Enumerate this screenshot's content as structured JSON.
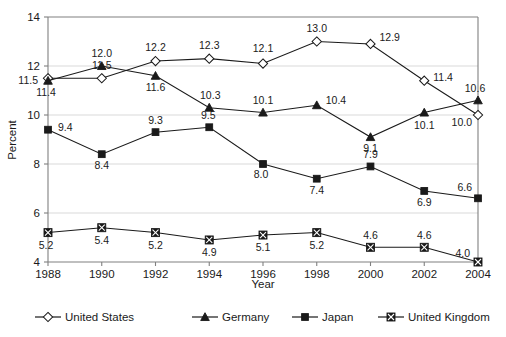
{
  "chart_data": {
    "type": "line",
    "title": "",
    "xlabel": "Year",
    "ylabel": "Percent",
    "x": [
      1988,
      1990,
      1992,
      1994,
      1996,
      1998,
      2000,
      2002,
      2004
    ],
    "xtick_labels": [
      "1988",
      "1990",
      "1992",
      "1994",
      "1996",
      "1998",
      "2000",
      "2002",
      "2004"
    ],
    "ytick_labels": [
      "4",
      "6",
      "8",
      "10",
      "12",
      "14"
    ],
    "yticks": [
      4,
      6,
      8,
      10,
      12,
      14
    ],
    "ylim": [
      4,
      14
    ],
    "xlim": [
      1988,
      2004
    ],
    "grid": "horizontal",
    "legend_position": "bottom",
    "series": [
      {
        "name": "United States",
        "marker": "open-diamond",
        "values": [
          11.5,
          11.5,
          12.2,
          12.3,
          12.1,
          13.0,
          12.9,
          11.4,
          10.0
        ],
        "labels": [
          "11.5",
          "11.5",
          "12.2",
          "12.3",
          "12.1",
          "13.0",
          "12.9",
          "11.4",
          "10.0"
        ]
      },
      {
        "name": "Germany",
        "marker": "solid-triangle",
        "values": [
          11.4,
          12.0,
          11.6,
          10.3,
          10.1,
          10.4,
          9.1,
          10.1,
          10.6
        ],
        "labels": [
          "11.4",
          "12.0",
          "11.6",
          "10.3",
          "10.1",
          "10.4",
          "9.1",
          "10.1",
          "10.6"
        ]
      },
      {
        "name": "Japan",
        "marker": "solid-square",
        "values": [
          9.4,
          8.4,
          9.3,
          9.5,
          8.0,
          7.4,
          7.9,
          6.9,
          6.6
        ],
        "labels": [
          "9.4",
          "8.4",
          "9.3",
          "9.5",
          "8.0",
          "7.4",
          "7.9",
          "6.9",
          "6.6"
        ]
      },
      {
        "name": "United Kingdom",
        "marker": "crossed-square",
        "values": [
          5.2,
          5.4,
          5.2,
          4.9,
          5.1,
          5.2,
          4.6,
          4.6,
          4.0
        ],
        "labels": [
          "5.2",
          "5.4",
          "5.2",
          "4.9",
          "5.1",
          "5.2",
          "4.6",
          "4.6",
          "4.0"
        ]
      }
    ],
    "colors": {
      "line": "#1a1a1a",
      "grid": "#d9d9d9",
      "frame": "#808080",
      "background": "#ffffff"
    }
  }
}
